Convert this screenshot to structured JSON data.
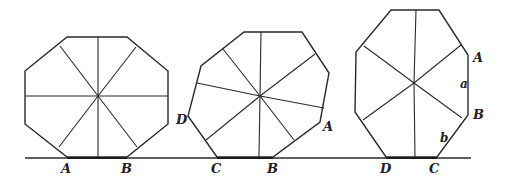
{
  "figure": {
    "width": 505,
    "height": 184,
    "line_color": "#2a2a2a",
    "background": "#ffffff",
    "baseline": {
      "x1": 25,
      "x2": 471,
      "y": 158
    },
    "shapes": [
      {
        "name": "regular-octagon",
        "vertices": [
          [
            67,
            37
          ],
          [
            127,
            37
          ],
          [
            168,
            71
          ],
          [
            168,
            124
          ],
          [
            127,
            157
          ],
          [
            67,
            157
          ],
          [
            25,
            124
          ],
          [
            25,
            71
          ]
        ],
        "center": [
          98,
          96
        ],
        "spoke_ends": [
          [
            98,
            37
          ],
          [
            136,
            47
          ],
          [
            168,
            96
          ],
          [
            137,
            147
          ],
          [
            98,
            157
          ],
          [
            59,
            147
          ],
          [
            25,
            96
          ],
          [
            60,
            46
          ]
        ],
        "contact": [
          [
            67,
            158
          ],
          [
            127,
            158
          ]
        ],
        "labels": [
          {
            "text": "A",
            "x": 61,
            "y": 173
          },
          {
            "text": "B",
            "x": 121,
            "y": 173
          }
        ]
      },
      {
        "name": "irregular-octagon",
        "vertices": [
          [
            244,
            32
          ],
          [
            302,
            32
          ],
          [
            329,
            73
          ],
          [
            320,
            122
          ],
          [
            273,
            157
          ],
          [
            217,
            157
          ],
          [
            188,
            116
          ],
          [
            201,
            66
          ]
        ],
        "center": [
          260,
          96
        ],
        "spoke_ends": [
          [
            261,
            32
          ],
          [
            315,
            54
          ],
          [
            324,
            108
          ],
          [
            294,
            140
          ],
          [
            259,
            157
          ],
          [
            206,
            140
          ],
          [
            197,
            83
          ],
          [
            223,
            49
          ]
        ],
        "contact": [
          [
            217,
            158
          ],
          [
            273,
            158
          ]
        ],
        "labels": [
          {
            "text": "D",
            "x": 176,
            "y": 124
          },
          {
            "text": "A",
            "x": 323,
            "y": 131
          },
          {
            "text": "C",
            "x": 211,
            "y": 173
          },
          {
            "text": "B",
            "x": 267,
            "y": 173
          }
        ]
      },
      {
        "name": "elongated-octagon",
        "vertices": [
          [
            391,
            10
          ],
          [
            439,
            10
          ],
          [
            468,
            55
          ],
          [
            468,
            115
          ],
          [
            437,
            157
          ],
          [
            386,
            157
          ],
          [
            355,
            112
          ],
          [
            356,
            52
          ]
        ],
        "center": [
          414,
          83
        ],
        "spoke_ends": [
          [
            416,
            10
          ],
          [
            461,
            45
          ],
          [
            462,
            118
          ],
          [
            415,
            157
          ],
          [
            363,
            120
          ],
          [
            364,
            46
          ]
        ],
        "contact": [
          [
            386,
            158
          ],
          [
            437,
            158
          ]
        ],
        "labels": [
          {
            "text": "A",
            "x": 473,
            "y": 62
          },
          {
            "text": "a",
            "x": 460,
            "y": 88
          },
          {
            "text": "B",
            "x": 473,
            "y": 119
          },
          {
            "text": "b",
            "x": 440,
            "y": 142
          },
          {
            "text": "D",
            "x": 380,
            "y": 173
          },
          {
            "text": "C",
            "x": 429,
            "y": 173
          }
        ]
      }
    ]
  }
}
